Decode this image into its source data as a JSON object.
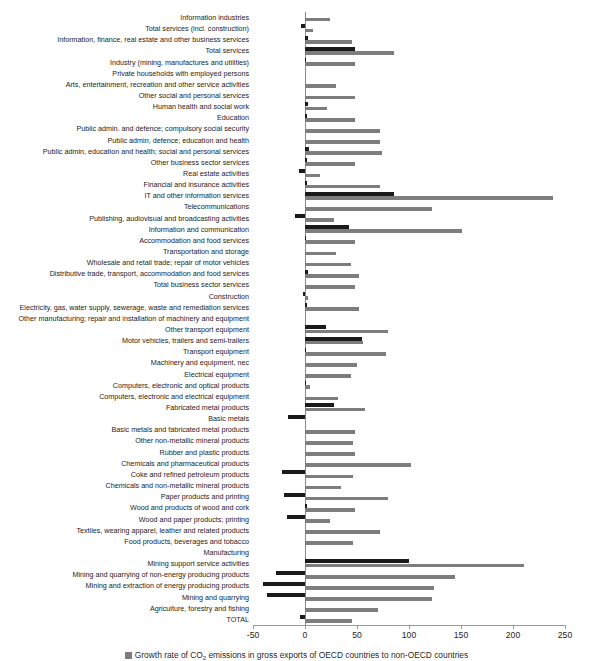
{
  "chart_data": {
    "type": "bar",
    "orientation": "horizontal",
    "title": "",
    "xlabel": "",
    "ylabel": "",
    "xlim": [
      -50,
      250
    ],
    "xticks": [
      -50,
      0,
      50,
      100,
      150,
      200,
      250
    ],
    "xtick_labels": [
      "-50",
      "0",
      "50",
      "100",
      "150",
      "200",
      "250"
    ],
    "grid": false,
    "legend_position": "bottom",
    "colors": {
      "series_1": "#7d7d7d",
      "series_2": "#1a1a1a",
      "axis": "#9a9a9a"
    },
    "series": [
      {
        "name": "Growth rate of CO2 emissions in gross exports of OECD countries to non-OECD countries",
        "color": "#7d7d7d",
        "values": [
          24,
          8,
          45,
          86,
          48,
          0,
          30,
          48,
          21,
          48,
          72,
          72,
          74,
          48,
          14,
          72,
          238,
          122,
          28,
          151,
          48,
          30,
          44,
          52,
          48,
          3,
          52,
          0,
          80,
          56,
          78,
          50,
          44,
          5,
          32,
          58,
          0,
          48,
          46,
          48,
          102,
          46,
          35,
          80,
          48,
          24,
          72,
          46,
          0,
          211,
          144,
          124,
          122,
          70,
          45
        ]
      },
      {
        "name": "Growth rate of CO2 emissions in domestic final demand",
        "color": "#1a1a1a",
        "values": [
          0,
          -4,
          3,
          48,
          1,
          0,
          0,
          0,
          3,
          2,
          0,
          0,
          4,
          2,
          -6,
          2,
          86,
          0,
          -10,
          42,
          1,
          0,
          0,
          3,
          0,
          -2,
          2,
          0,
          20,
          55,
          1,
          0,
          0,
          1,
          0,
          28,
          -16,
          0,
          0,
          0,
          0,
          -22,
          0,
          -20,
          2,
          -17,
          0,
          0,
          0,
          100,
          -28,
          -40,
          -37,
          0,
          -5
        ]
      }
    ],
    "categories": [
      "Information industries",
      "Total services (incl. construction)",
      "Information, finance, real estate and other business services",
      "Total services",
      "Industry (mining, manufactures and utilities)",
      "Private households with employed persons",
      "Arts, entertainment, recreation and other service activities",
      "Other social and personal services",
      "Human health and social work",
      "Education",
      "Public admin. and defence; compulsory social security",
      "Public admin, defence; education and health",
      "Public admin, education and health; social and personal services",
      "Other business sector services",
      "Real estate activities",
      "Financial and insurance activities",
      "IT and other information services",
      "Telecommunications",
      "Publishing, audiovisual and broadcasting activities",
      "Information and communication",
      "Accommodation and food services",
      "Transportation and storage",
      "Wholesale and retail trade; repair of motor vehicles",
      "Distributive trade, transport, accommodation and food services",
      "Total business sector services",
      "Construction",
      "Electricity, gas, water supply, sewerage, waste and remediation services",
      "Other manufacturing; repair and installation of machinery and equipment",
      "Other transport equipment",
      "Motor vehicles, trailers and semi-trailers",
      "Transport equipment",
      "Machinery and equipment, nec",
      "Electrical equipment",
      "Computers, electronic and optical products",
      "Computers, electronic and electrical equipment",
      "Fabricated metal products",
      "Basic metals",
      "Basic metals and fabricated metal products",
      "Other non-metallic mineral products",
      "Rubber and plastic products",
      "Chemicals and pharmaceutical products",
      "Coke and refined petroleum products",
      "Chemicals and non-metallic mineral products",
      "Paper products and printing",
      "Wood and products of wood and cork",
      "Wood and paper products; printing",
      "Textiles, wearing apparel, leather and related products",
      "Food products, beverages and tobacco",
      "Manufacturing",
      "Mining support service activities",
      "Mining and quarrying of non-energy producing products",
      "Mining and extraction of energy producing products",
      "Mining and quarrying",
      "Agriculture, forestry and fishing",
      "TOTAL"
    ]
  },
  "legend": {
    "entries": [
      {
        "marker": "legend-swatch-light",
        "text": "Growth rate of CO2 emissions in gross exports of OECD countries to non-OECD countries"
      }
    ]
  }
}
